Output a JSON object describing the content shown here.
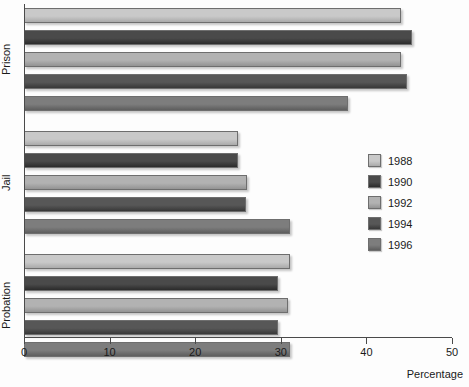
{
  "chart_data": {
    "type": "bar",
    "orientation": "horizontal",
    "title": "",
    "xlabel": "Percentage",
    "ylabel": "",
    "xlim": [
      0,
      50
    ],
    "xticks": [
      0,
      10,
      20,
      30,
      40,
      50
    ],
    "xtick_labels": [
      "0",
      "10",
      "20",
      "30",
      "40",
      "50"
    ],
    "grid": false,
    "legend_position": "right",
    "categories": [
      "Prison",
      "Jail",
      "Probation"
    ],
    "series": [
      {
        "name": "1988",
        "color": "#c9c9c9",
        "values": [
          44.0,
          25.0,
          31.1
        ]
      },
      {
        "name": "1990",
        "color": "#4a4a4a",
        "values": [
          45.3,
          25.0,
          29.7
        ]
      },
      {
        "name": "1992",
        "color": "#b2b2b2",
        "values": [
          44.1,
          26.0,
          30.8
        ]
      },
      {
        "name": "1994",
        "color": "#575757",
        "values": [
          44.7,
          25.9,
          29.7
        ]
      },
      {
        "name": "1996",
        "color": "#7d7d7d",
        "values": [
          37.9,
          31.1,
          31.1
        ]
      }
    ]
  },
  "axis": {
    "x_title": "Percentage"
  },
  "legend": {
    "entries": [
      {
        "label": "1988"
      },
      {
        "label": "1990"
      },
      {
        "label": "1992"
      },
      {
        "label": "1994"
      },
      {
        "label": "1996"
      }
    ]
  }
}
